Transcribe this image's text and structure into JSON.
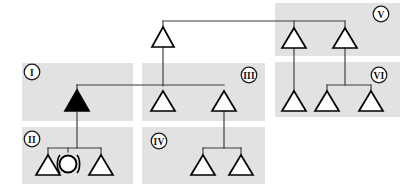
{
  "diagram": {
    "canvas": {
      "width": 411,
      "height": 190,
      "background": "#ffffff"
    },
    "colors": {
      "group_box": "#e2e2e2",
      "link": "#3a3a3a",
      "node_stroke": "#000000",
      "node_open_fill": "#ffffff",
      "node_filled_fill": "#000000",
      "label_text": "#111111"
    },
    "groups": [
      {
        "id": "I",
        "label": "I",
        "x": 22,
        "y": 63,
        "width": 111,
        "height": 58,
        "label_x": 31,
        "label_y": 72
      },
      {
        "id": "II",
        "label": "II",
        "x": 22,
        "y": 127,
        "width": 111,
        "height": 57,
        "label_x": 31,
        "label_y": 138
      },
      {
        "id": "III",
        "label": "III",
        "x": 142,
        "y": 63,
        "width": 123,
        "height": 58,
        "label_x": 251,
        "label_y": 75
      },
      {
        "id": "IV",
        "label": "IV",
        "x": 142,
        "y": 127,
        "width": 123,
        "height": 57,
        "label_x": 158,
        "label_y": 141
      },
      {
        "id": "V",
        "label": "V",
        "x": 275,
        "y": 3,
        "width": 125,
        "height": 53,
        "label_x": 384,
        "label_y": 14
      },
      {
        "id": "VI",
        "label": "VI",
        "x": 275,
        "y": 62,
        "width": 125,
        "height": 55,
        "label_x": 380,
        "label_y": 75
      }
    ],
    "nodes": [
      {
        "id": "n-top",
        "group": "III",
        "shape": "triangle",
        "state": "open",
        "cx": 163,
        "cy": 38,
        "size": 19
      },
      {
        "id": "n-v-1",
        "group": "V",
        "shape": "triangle",
        "state": "open",
        "cx": 294,
        "cy": 38,
        "size": 19
      },
      {
        "id": "n-v-2",
        "group": "V",
        "shape": "triangle",
        "state": "open",
        "cx": 345,
        "cy": 38,
        "size": 19
      },
      {
        "id": "n-i-1",
        "group": "I",
        "shape": "triangle",
        "state": "filled",
        "cx": 77,
        "cy": 102,
        "size": 19
      },
      {
        "id": "n-iii-1",
        "group": "III",
        "shape": "triangle",
        "state": "open",
        "cx": 163,
        "cy": 102,
        "size": 19
      },
      {
        "id": "n-iii-2",
        "group": "III",
        "shape": "triangle",
        "state": "open",
        "cx": 224,
        "cy": 102,
        "size": 19
      },
      {
        "id": "n-vi-1",
        "group": "VI",
        "shape": "triangle",
        "state": "open",
        "cx": 294,
        "cy": 102,
        "size": 19
      },
      {
        "id": "n-vi-2",
        "group": "VI",
        "shape": "triangle",
        "state": "open",
        "cx": 327,
        "cy": 102,
        "size": 19
      },
      {
        "id": "n-vi-3",
        "group": "VI",
        "shape": "triangle",
        "state": "open",
        "cx": 371,
        "cy": 102,
        "size": 19
      },
      {
        "id": "n-ii-1",
        "group": "II",
        "shape": "triangle",
        "state": "open",
        "cx": 48,
        "cy": 165,
        "size": 19
      },
      {
        "id": "n-ii-2",
        "group": "II",
        "shape": "circle",
        "state": "open-parenthesized",
        "cx": 68,
        "cy": 161,
        "size": 9
      },
      {
        "id": "n-ii-3",
        "group": "II",
        "shape": "triangle",
        "state": "open",
        "cx": 101,
        "cy": 165,
        "size": 19
      },
      {
        "id": "n-iv-1",
        "group": "IV",
        "shape": "triangle",
        "state": "open",
        "cx": 203,
        "cy": 165,
        "size": 19
      },
      {
        "id": "n-iv-2",
        "group": "IV",
        "shape": "triangle",
        "state": "open",
        "cx": 241,
        "cy": 165,
        "size": 19
      }
    ],
    "links": [
      {
        "id": "l-top-span",
        "from": "n-top",
        "to": "n-v-1,n-v-2",
        "points": "163,21 163,26 M163,21 345,21 M294,21 294,29 M345,21 345,29"
      },
      {
        "id": "l-top-down",
        "from": "n-top",
        "to": "n-iii-1",
        "points": "163,38 163,85"
      },
      {
        "id": "l-i-span",
        "from": "n-i-1",
        "to": "n-iii-2",
        "points": "77,85 224,85 M77,85 77,92"
      },
      {
        "id": "l-i-down",
        "from": "n-i-1",
        "to": "n-ii-sib",
        "points": "77,105 77,148"
      },
      {
        "id": "l-ii-sib",
        "from": "n-ii-sib",
        "to": "n-ii-1,n-ii-2,n-ii-3",
        "points": "48,148 101,148 M48,148 48,156 M68,148 68,152 M101,148 101,156"
      },
      {
        "id": "l-iii2-down",
        "from": "n-iii-2",
        "to": "n-iv-sib",
        "points": "224,102 224,148"
      },
      {
        "id": "l-iv-sib",
        "from": "n-iv-sib",
        "to": "n-iv-1,n-iv-2",
        "points": "203,148 241,148 M203,148 203,156 M241,148 241,156"
      },
      {
        "id": "l-v1-down",
        "from": "n-v-1",
        "to": "n-vi-1",
        "points": "294,38 294,92"
      },
      {
        "id": "l-v2-down",
        "from": "n-v-2",
        "to": "n-vi-sib",
        "points": "345,38 345,85"
      },
      {
        "id": "l-vi-sib",
        "from": "n-vi-sib",
        "to": "n-vi-2,n-vi-3",
        "points": "327,85 371,85 M327,85 327,92 M371,85 371,92"
      }
    ]
  }
}
